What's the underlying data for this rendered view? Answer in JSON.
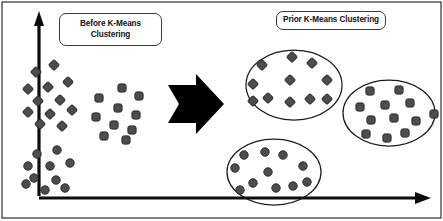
{
  "figure": {
    "title_before": {
      "line1": "Before K-Means",
      "line2": "Clustering"
    },
    "title_prior": {
      "line1": "Prior K-Means Clustering"
    },
    "transition_arrow": "right-arrow-icon",
    "axes": {
      "y_axis": "vertical-axis-arrow",
      "x_axis": "horizontal-axis-arrow"
    },
    "colors": {
      "marker_fill": "#4d4d4d",
      "marker_stroke": "#2b2b2b",
      "hull_stroke": "#1c1c1c",
      "axis": "#0d0d0d",
      "frame": "#1a1a1a",
      "arrow": "#000000",
      "background": "#ffffff"
    }
  },
  "chart_data": {
    "type": "scatter",
    "xlabel": "",
    "ylabel": "",
    "grid": false,
    "legend": "none",
    "xlim": [
      0,
      443
    ],
    "ylim": [
      0,
      221
    ],
    "annotations": [
      {
        "text": "Before K-Means Clustering",
        "x": 110,
        "y": 29
      },
      {
        "text": "Prior K-Means Clustering",
        "x": 331,
        "y": 20
      }
    ],
    "series": [
      {
        "name": "unclustered-diamonds",
        "marker": "diamond",
        "panel": "before",
        "hull": null,
        "points": [
          {
            "x": 36,
            "y": 72
          },
          {
            "x": 54,
            "y": 65
          },
          {
            "x": 28,
            "y": 89
          },
          {
            "x": 48,
            "y": 87
          },
          {
            "x": 68,
            "y": 82
          },
          {
            "x": 38,
            "y": 101
          },
          {
            "x": 60,
            "y": 100
          },
          {
            "x": 28,
            "y": 112
          },
          {
            "x": 50,
            "y": 114
          },
          {
            "x": 72,
            "y": 110
          },
          {
            "x": 40,
            "y": 124
          },
          {
            "x": 62,
            "y": 126
          }
        ]
      },
      {
        "name": "unclustered-squares",
        "marker": "rounded-square",
        "panel": "before",
        "hull": null,
        "points": [
          {
            "x": 122,
            "y": 88
          },
          {
            "x": 99,
            "y": 98
          },
          {
            "x": 139,
            "y": 96
          },
          {
            "x": 118,
            "y": 108
          },
          {
            "x": 96,
            "y": 117
          },
          {
            "x": 136,
            "y": 115
          },
          {
            "x": 114,
            "y": 125
          },
          {
            "x": 132,
            "y": 130
          },
          {
            "x": 104,
            "y": 136
          },
          {
            "x": 126,
            "y": 140
          }
        ]
      },
      {
        "name": "unclustered-circles",
        "marker": "circle",
        "panel": "before",
        "hull": null,
        "points": [
          {
            "x": 37,
            "y": 154
          },
          {
            "x": 57,
            "y": 150
          },
          {
            "x": 28,
            "y": 166
          },
          {
            "x": 50,
            "y": 166
          },
          {
            "x": 70,
            "y": 163
          },
          {
            "x": 34,
            "y": 178
          },
          {
            "x": 56,
            "y": 180
          },
          {
            "x": 26,
            "y": 184
          },
          {
            "x": 45,
            "y": 190
          },
          {
            "x": 65,
            "y": 188
          }
        ]
      },
      {
        "name": "cluster-diamonds",
        "marker": "diamond",
        "panel": "prior",
        "hull": {
          "cx": 294,
          "cy": 85,
          "rx": 48,
          "ry": 35
        },
        "points": [
          {
            "x": 292,
            "y": 57
          },
          {
            "x": 262,
            "y": 65
          },
          {
            "x": 312,
            "y": 63
          },
          {
            "x": 290,
            "y": 80
          },
          {
            "x": 253,
            "y": 84
          },
          {
            "x": 327,
            "y": 80
          },
          {
            "x": 268,
            "y": 98
          },
          {
            "x": 290,
            "y": 102
          },
          {
            "x": 310,
            "y": 99
          },
          {
            "x": 253,
            "y": 101
          },
          {
            "x": 327,
            "y": 99
          }
        ]
      },
      {
        "name": "cluster-squares",
        "marker": "rounded-square",
        "panel": "prior",
        "hull": {
          "cx": 389,
          "cy": 113,
          "rx": 46,
          "ry": 33
        },
        "points": [
          {
            "x": 370,
            "y": 91
          },
          {
            "x": 399,
            "y": 90
          },
          {
            "x": 385,
            "y": 105
          },
          {
            "x": 410,
            "y": 103
          },
          {
            "x": 360,
            "y": 107
          },
          {
            "x": 371,
            "y": 120
          },
          {
            "x": 394,
            "y": 118
          },
          {
            "x": 416,
            "y": 121
          },
          {
            "x": 434,
            "y": 114
          },
          {
            "x": 366,
            "y": 134
          },
          {
            "x": 387,
            "y": 138
          },
          {
            "x": 405,
            "y": 133
          }
        ]
      },
      {
        "name": "cluster-circles",
        "marker": "circle",
        "panel": "prior",
        "hull": {
          "cx": 274,
          "cy": 172,
          "rx": 47,
          "ry": 33
        },
        "points": [
          {
            "x": 244,
            "y": 155
          },
          {
            "x": 265,
            "y": 152
          },
          {
            "x": 283,
            "y": 155
          },
          {
            "x": 235,
            "y": 168
          },
          {
            "x": 268,
            "y": 172
          },
          {
            "x": 303,
            "y": 166
          },
          {
            "x": 253,
            "y": 183
          },
          {
            "x": 307,
            "y": 182
          },
          {
            "x": 276,
            "y": 188
          },
          {
            "x": 293,
            "y": 186
          },
          {
            "x": 240,
            "y": 190
          }
        ]
      }
    ]
  }
}
